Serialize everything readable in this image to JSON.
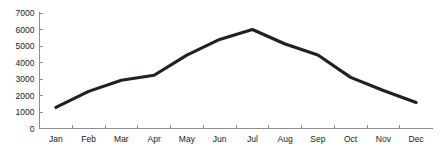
{
  "chart_data": {
    "type": "line",
    "title": "",
    "subtitle": "",
    "xlabel": "",
    "ylabel": "",
    "categories": [
      "Jan",
      "Feb",
      "Mar",
      "Apr",
      "May",
      "Jun",
      "Jul",
      "Aug",
      "Sep",
      "Oct",
      "Nov",
      "Dec"
    ],
    "series": [
      {
        "name": "",
        "values": [
          1280,
          2250,
          2930,
          3230,
          4450,
          5400,
          6000,
          5120,
          4450,
          3100,
          2300,
          1580
        ]
      }
    ],
    "ylim": [
      0,
      7000
    ],
    "yticks": [
      0,
      1000,
      2000,
      3000,
      4000,
      5000,
      6000,
      7000
    ],
    "ytick_labels": [
      "0",
      "1000",
      "2000",
      "3000",
      "4000",
      "5000",
      "6000",
      "7000"
    ],
    "xtick_labels": [
      "Jan",
      "Feb",
      "Mar",
      "Apr",
      "May",
      "Jun",
      "Jul",
      "Aug",
      "Sep",
      "Oct",
      "Nov",
      "Dec"
    ],
    "grid": false,
    "legend": false,
    "legend_position": "none",
    "markers": false,
    "series_color": "#231f20",
    "axis_color": "#8d8d8d",
    "background_color": "#ffffff",
    "annotations": []
  }
}
